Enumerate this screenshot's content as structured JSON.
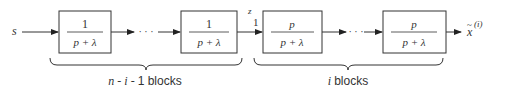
{
  "diagram": {
    "input_label": "s",
    "intermediate_label": {
      "main": "z",
      "sub": "1"
    },
    "output_label": {
      "main": "x",
      "accent": "~",
      "sup": "(i)"
    },
    "ellipsis": "· · ·",
    "blocks": [
      {
        "numerator": "1",
        "denominator": "p + λ"
      },
      {
        "numerator": "1",
        "denominator": "p + λ"
      },
      {
        "numerator": "p",
        "denominator": "p + λ"
      },
      {
        "numerator": "p",
        "denominator": "p + λ"
      }
    ],
    "groups": [
      {
        "label_italic": "n - i -",
        "label_rest": "1 blocks"
      },
      {
        "label_italic": "i",
        "label_rest": " blocks"
      }
    ],
    "colors": {
      "stroke": "#333333",
      "background": "#ffffff"
    }
  }
}
